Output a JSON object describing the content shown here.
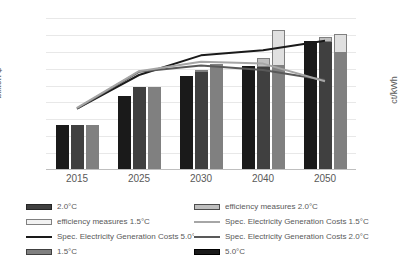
{
  "chart_data": {
    "type": "bar",
    "title": "",
    "subtitle": "",
    "xlabel": "",
    "ylabel": "billion $",
    "y2label": "ct/kWh",
    "categories": [
      "2015",
      "2025",
      "2030",
      "2040",
      "2050"
    ],
    "ylim": [
      0,
      900
    ],
    "y2lim": [
      0,
      12
    ],
    "yticks": [
      "900",
      "800",
      "700",
      "600",
      "500",
      "400",
      "300",
      "200",
      "100",
      "0"
    ],
    "y2ticks": [
      "12",
      "10",
      "8",
      "6",
      "4",
      "2",
      "0"
    ],
    "grid": true,
    "legend_position": "bottom",
    "bar_series": [
      {
        "name": "5.0°C",
        "color": "#1a1a1a",
        "axis": "left",
        "values": [
          265,
          440,
          557,
          615,
          765
        ]
      },
      {
        "name": "2.0°C",
        "color": "#404040",
        "axis": "left",
        "values": [
          267,
          492,
          580,
          612,
          760
        ]
      },
      {
        "name": "efficiency measures 2.0°C",
        "color": "#bfbfbf",
        "axis": "left",
        "stacked_on": "2.0°C",
        "values": [
          0,
          0,
          10,
          50,
          30
        ]
      },
      {
        "name": "1.5°C",
        "color": "#808080",
        "axis": "left",
        "values": [
          267,
          478,
          618,
          615,
          695
        ]
      },
      {
        "name": "efficiency measures 1.5°C",
        "color": "#e0e0e0",
        "axis": "left",
        "stacked_on": "1.5°C",
        "values": [
          0,
          7,
          12,
          215,
          110
        ]
      }
    ],
    "line_series": [
      {
        "name": "Spec. Electricity Generation Costs 5.0°C",
        "color": "#1a1a1a",
        "axis": "right",
        "values": [
          4.85,
          7.5,
          9.05,
          9.45,
          10.2
        ]
      },
      {
        "name": "Spec. Electricity Generation Costs 2.0°C",
        "color": "#595959",
        "axis": "right",
        "values": [
          4.85,
          7.75,
          8.25,
          7.9,
          7.1
        ]
      },
      {
        "name": "Spec. Electricity Generation Costs 1.5°C",
        "color": "#a6a6a6",
        "axis": "right",
        "values": [
          4.9,
          7.8,
          8.55,
          8.4,
          7.0
        ]
      }
    ]
  },
  "axes": {
    "left_title": "billion $",
    "right_title": "ct/kWh"
  },
  "legend": {
    "items": [
      {
        "label": "2.0°C",
        "marker": "box",
        "color": "#404040",
        "border": "#262626"
      },
      {
        "label": "efficiency measures 2.0°C",
        "marker": "box",
        "color": "#bfbfbf",
        "border": "#4d4d4d"
      },
      {
        "label": "efficiency measures 1.5°C",
        "marker": "box",
        "color": "#f2f2f2",
        "border": "#808080"
      },
      {
        "label": "Spec. Electricity Generation Costs 1.5°C",
        "marker": "line",
        "color": "#a6a6a6"
      },
      {
        "label": "Spec. Electricity Generation Costs 5.0°C",
        "marker": "line",
        "color": "#1a1a1a"
      },
      {
        "label": "Spec. Electricity Generation Costs 2.0°C",
        "marker": "line",
        "color": "#595959"
      },
      {
        "label": "1.5°C",
        "marker": "box",
        "color": "#808080",
        "border": "#404040"
      },
      {
        "label": "5.0°C",
        "marker": "box",
        "color": "#1a1a1a",
        "border": "#000000"
      }
    ]
  }
}
